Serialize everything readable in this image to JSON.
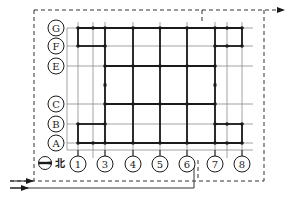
{
  "diagram": {
    "title": "",
    "colors": {
      "ink": "#1a1a1a",
      "thin": "#7a7a7a",
      "background": "#ffffff"
    },
    "rows": [
      {
        "label": "G",
        "y": 28
      },
      {
        "label": "F",
        "y": 46
      },
      {
        "label": "E",
        "y": 66
      },
      {
        "label": "C",
        "y": 104
      },
      {
        "label": "B",
        "y": 124
      },
      {
        "label": "A",
        "y": 143
      }
    ],
    "columns": [
      {
        "label": "1",
        "x": 78
      },
      {
        "label": "3",
        "x": 105
      },
      {
        "label": "4",
        "x": 133
      },
      {
        "label": "5",
        "x": 160
      },
      {
        "label": "6",
        "x": 187
      },
      {
        "label": "7",
        "x": 215
      },
      {
        "label": "8",
        "x": 242
      }
    ],
    "north_label": "北",
    "north_icon": "north-arrow-icon"
  }
}
